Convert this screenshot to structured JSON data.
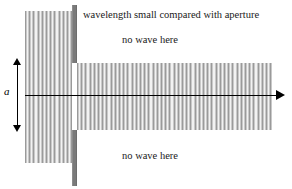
{
  "figure": {
    "width": 292,
    "height": 189,
    "background_color": "#ffffff"
  },
  "annotations": {
    "caption": "wavelength small compared with aperture",
    "no_wave_top": "no wave here",
    "no_wave_bottom": "no wave here",
    "aperture_label": "a"
  },
  "colors": {
    "barrier": "#7a7a7a",
    "wavefront_dark": "#9a9a9a",
    "wavefront_light": "#f2f2f2",
    "axis": "#000000",
    "text": "#1a1a1a"
  },
  "geometry": {
    "incident_wavefield": {
      "x": 25,
      "y": 11,
      "width": 47,
      "height": 152
    },
    "transmitted_wavefield": {
      "x": 77,
      "y": 63,
      "width": 195,
      "height": 67
    },
    "barrier_upper": {
      "x": 72,
      "y": 5,
      "width": 5,
      "height": 58
    },
    "barrier_lower": {
      "x": 72,
      "y": 130,
      "width": 5,
      "height": 56
    },
    "aperture_gap": {
      "y_top": 63,
      "y_bottom": 130,
      "size": 67
    },
    "optical_axis": {
      "y": 95,
      "x_start": 25,
      "x_end": 285
    }
  },
  "chart_data": {
    "type": "diagram",
    "title": "wavelength small compared with aperture",
    "elements": [
      {
        "name": "incident plane wave",
        "region": "left of barrier",
        "label": ""
      },
      {
        "name": "barrier with slit",
        "aperture_width_label": "a"
      },
      {
        "name": "transmitted beam",
        "region": "right of aperture",
        "note": "beam width equals aperture width, negligible spreading"
      },
      {
        "name": "shadow region above beam",
        "label": "no wave here"
      },
      {
        "name": "shadow region below beam",
        "label": "no wave here"
      }
    ]
  }
}
